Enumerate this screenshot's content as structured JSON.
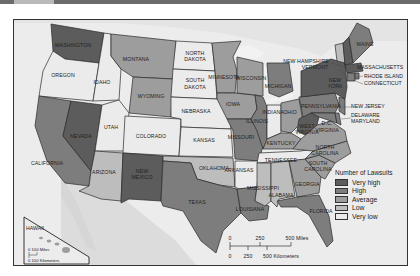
{
  "map": {
    "title_bar": "",
    "legend": {
      "title": "Number of Lawsuits",
      "items": [
        {
          "label": "Very high",
          "color": "#5c5c5c"
        },
        {
          "label": "High",
          "color": "#7d7d7d"
        },
        {
          "label": "Average",
          "color": "#9d9d9d"
        },
        {
          "label": "Low",
          "color": "#bdbdbd"
        },
        {
          "label": "Very low",
          "color": "#ebebeb"
        }
      ]
    },
    "scale": {
      "miles_ticks": [
        "0",
        "250",
        "500 Miles"
      ],
      "km_ticks": [
        "0",
        "250",
        "500 Kilometers"
      ]
    },
    "hawaii_inset": {
      "label": "HAWAII",
      "miles": "0   100 Miles",
      "km": "0  100 Kilometers"
    },
    "states": {
      "washington": {
        "label": "WASHINGTON",
        "level": "Very high"
      },
      "oregon": {
        "label": "OREGON",
        "level": "Very low"
      },
      "california": {
        "label": "CALIFORNIA",
        "level": "High"
      },
      "nevada": {
        "label": "NEVADA",
        "level": "Very high"
      },
      "idaho": {
        "label": "IDAHO",
        "level": "Very low"
      },
      "montana": {
        "label": "MONTANA",
        "level": "Average"
      },
      "wyoming": {
        "label": "WYOMING",
        "level": "Average"
      },
      "utah": {
        "label": "UTAH",
        "level": "Very low"
      },
      "colorado": {
        "label": "COLORADO",
        "level": "Very low"
      },
      "arizona": {
        "label": "ARIZONA",
        "level": "Low"
      },
      "new_mexico": {
        "label": "NEW MEXICO",
        "level": "Very high"
      },
      "north_dakota": {
        "label": "NORTH DAKOTA",
        "level": "Very low"
      },
      "south_dakota": {
        "label": "SOUTH DAKOTA",
        "level": "Very low"
      },
      "nebraska": {
        "label": "NEBRASKA",
        "level": "Very low"
      },
      "kansas": {
        "label": "KANSAS",
        "level": "Very low"
      },
      "oklahoma": {
        "label": "OKLAHOMA",
        "level": "Low"
      },
      "texas": {
        "label": "TEXAS",
        "level": "High"
      },
      "minnesota": {
        "label": "MINNESOTA",
        "level": "Average"
      },
      "iowa": {
        "label": "IOWA",
        "level": "Average"
      },
      "missouri": {
        "label": "MISSOURI",
        "level": "High"
      },
      "arkansas": {
        "label": "ARKANSAS",
        "level": "Very low"
      },
      "louisiana": {
        "label": "LOUISIANA",
        "level": "High"
      },
      "wisconsin": {
        "label": "WISCONSIN",
        "level": "Average"
      },
      "illinois": {
        "label": "ILLINOIS",
        "level": "High"
      },
      "michigan": {
        "label": "MICHIGAN",
        "level": "High"
      },
      "indiana": {
        "label": "INDIANA",
        "level": "Very low"
      },
      "ohio": {
        "label": "OHIO",
        "level": "Average"
      },
      "kentucky": {
        "label": "KENTUCKY",
        "level": "Average"
      },
      "tennessee": {
        "label": "TENNESSEE",
        "level": "Very low"
      },
      "mississippi": {
        "label": "MISSISSIPPI",
        "level": "Low"
      },
      "alabama": {
        "label": "ALABAMA",
        "level": "Low"
      },
      "georgia": {
        "label": "GEORGIA",
        "level": "Average"
      },
      "florida": {
        "label": "FLORIDA",
        "level": "High"
      },
      "south_carolina": {
        "label": "SOUTH CAROLINA",
        "level": "Average"
      },
      "north_carolina": {
        "label": "NORTH CAROLINA",
        "level": "Average"
      },
      "virginia": {
        "label": "VIRGINIA",
        "level": "Average"
      },
      "west_virginia": {
        "label": "WEST VIRGINIA",
        "level": "Very high"
      },
      "pennsylvania": {
        "label": "PENNSYLVANIA",
        "level": "High"
      },
      "new_york": {
        "label": "NEW YORK",
        "level": "Very high"
      },
      "new_jersey": {
        "label": "NEW JERSEY",
        "level": "High"
      },
      "delaware": {
        "label": "DELAWARE",
        "level": "High"
      },
      "maryland": {
        "label": "MARYLAND",
        "level": "High"
      },
      "dc": {
        "label": "D.C.",
        "level": "Very high"
      },
      "vermont": {
        "label": "VERMONT",
        "level": "Low"
      },
      "new_hampshire": {
        "label": "NEW HAMPSHIRE",
        "level": "Very high"
      },
      "maine": {
        "label": "MAINE",
        "level": "High"
      },
      "massachusetts": {
        "label": "MASSACHUSETTS",
        "level": "Very high"
      },
      "rhode_island": {
        "label": "RHODE ISLAND",
        "level": "High"
      },
      "connecticut": {
        "label": "CONNECTICUT",
        "level": "High"
      }
    }
  }
}
